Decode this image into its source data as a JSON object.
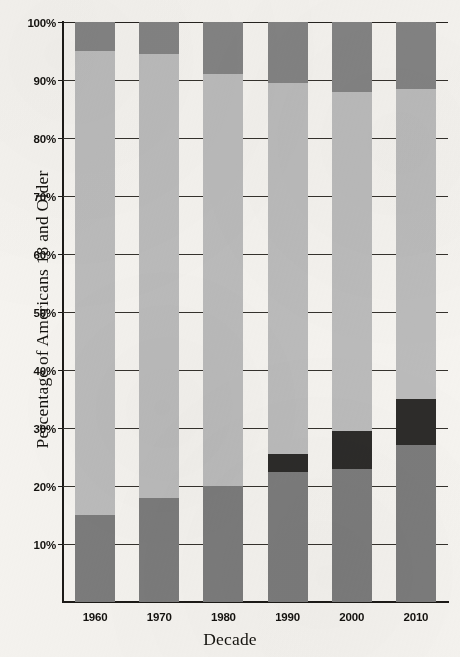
{
  "chart_data": {
    "type": "bar",
    "subtype": "stacked-100-percent",
    "title": "",
    "xlabel": "Decade",
    "ylabel": "Percentage of Americans 18 and Older",
    "categories": [
      "1960",
      "1970",
      "1980",
      "1990",
      "2000",
      "2010"
    ],
    "ylim": [
      0,
      100
    ],
    "ytick_labels": [
      "10%",
      "20%",
      "30%",
      "40%",
      "50%",
      "60%",
      "70%",
      "80%",
      "90%",
      "100%"
    ],
    "ytick_values": [
      10,
      20,
      30,
      40,
      50,
      60,
      70,
      80,
      90,
      100
    ],
    "grid": "horizontal",
    "legend": "none",
    "series": [
      {
        "name": "segment-bottom",
        "color": "#7c7c7c",
        "values": [
          15,
          18,
          20,
          22.5,
          23,
          27
        ]
      },
      {
        "name": "segment-dark",
        "color": "#2d2c2a",
        "values": [
          0,
          0,
          0,
          3,
          6.5,
          8
        ]
      },
      {
        "name": "segment-light",
        "color": "#bcbcbc",
        "values": [
          80,
          76.5,
          71,
          64,
          58.5,
          53.5
        ]
      },
      {
        "name": "segment-top",
        "color": "#848484",
        "values": [
          5,
          5.5,
          9,
          10.5,
          12,
          11.5
        ]
      }
    ],
    "stack_tops": {
      "bottom": [
        15,
        18,
        20,
        22.5,
        23,
        27
      ],
      "dark": [
        15,
        18,
        20,
        25.5,
        29.5,
        35
      ],
      "light": [
        95,
        94.5,
        91,
        89.5,
        88,
        88.5
      ],
      "top": [
        100,
        100,
        100,
        100,
        100,
        100
      ]
    }
  },
  "axes": {
    "y_title": "Percentage of Americans 18 and Older",
    "x_title": "Decade"
  },
  "colors": {
    "background": "#f6f4f0",
    "axis": "#1c1a17",
    "gridline": "#35322d",
    "text": "#14120f"
  }
}
